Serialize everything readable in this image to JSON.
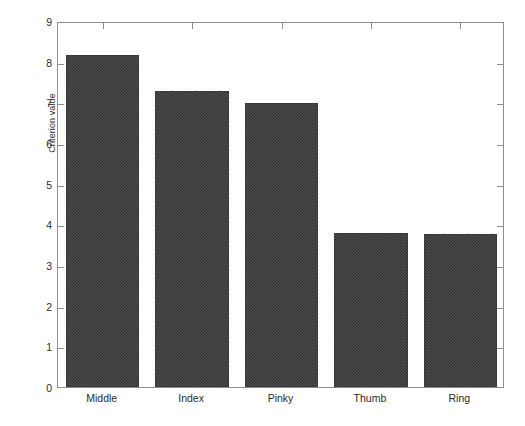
{
  "chart_data": {
    "type": "bar",
    "title": "",
    "subtitle": "",
    "xlabel": "",
    "ylabel": "Criterion value",
    "categories": [
      "Middle",
      "Index",
      "Pinky",
      "Thumb",
      "Ring"
    ],
    "values": [
      8.16,
      7.28,
      6.98,
      3.79,
      3.76
    ],
    "series": [
      {
        "name": "Criterion value",
        "values": [
          8.16,
          7.28,
          6.98,
          3.79,
          3.76
        ]
      }
    ],
    "ylim": [
      0,
      9
    ],
    "yticks": [
      0,
      1,
      2,
      3,
      4,
      5,
      6,
      7,
      8,
      9
    ],
    "ytick_labels": [
      "0",
      "1",
      "2",
      "3",
      "4",
      "5",
      "6",
      "7",
      "8",
      "9"
    ],
    "xtick_labels": [
      "Middle",
      "Index",
      "Pinky",
      "Thumb",
      "Ring"
    ],
    "grid": false,
    "legend": null,
    "legend_position": "none",
    "bar_color": "#4e4e4e",
    "bar_edge_color": "#3a3a3a",
    "axis_color": "#8e8e8e",
    "text_color": "#2b2b2b",
    "background_color": "#ffffff",
    "bar_width_fraction": 0.82,
    "annotations": []
  }
}
